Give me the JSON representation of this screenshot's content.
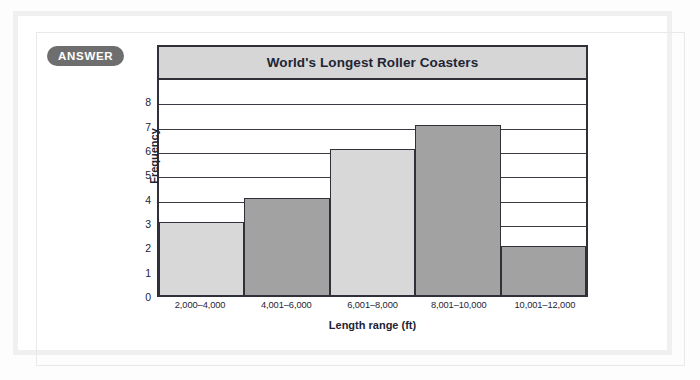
{
  "badge": {
    "label": "ANSWER"
  },
  "colors": {
    "badge_bg": "#6e6e6e",
    "title_banner_bg": "#d6d6d6",
    "frame_stroke": "#303038",
    "bar_light": "#d8d8d8",
    "bar_dark": "#a2a2a2",
    "text": "#1d2535",
    "card_border": "#f0f0f0"
  },
  "chart_data": {
    "type": "bar",
    "title": "World's Longest Roller Coasters",
    "xlabel": "Length range (ft)",
    "ylabel": "Frequency",
    "categories": [
      "2,000–4,000",
      "4,001–6,000",
      "6,001–8,000",
      "8,001–10,000",
      "10,001–12,000"
    ],
    "values": [
      3,
      4,
      6,
      7,
      2
    ],
    "bar_colors": [
      "#d8d8d8",
      "#a2a2a2",
      "#d8d8d8",
      "#a2a2a2",
      "#a2a2a2"
    ],
    "ylim": [
      0,
      9
    ],
    "yticks": [
      0,
      1,
      2,
      3,
      4,
      5,
      6,
      7,
      8
    ],
    "grid": true,
    "legend": false
  }
}
